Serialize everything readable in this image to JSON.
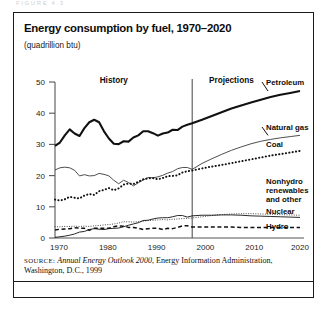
{
  "ghost_text": "FIGURE 4.3",
  "figure": {
    "title": "Energy consumption by fuel, 1970–2020",
    "subtitle": "(quadrillion btu)",
    "source": {
      "label": "SOURCE:",
      "italic_title": "Annual Energy Outlook 2000",
      "rest": ", Energy Information Administration, Washington, D.C., 1999"
    }
  },
  "chart_data": {
    "type": "line",
    "title": "Energy consumption by fuel, 1970–2020",
    "subtitle": "(quadrillion btu)",
    "xlabel": "",
    "ylabel": "quadrillion btu",
    "xlim": [
      1970,
      2020
    ],
    "ylim": [
      0,
      50
    ],
    "xticks": [
      1970,
      1980,
      1990,
      2000,
      2010,
      2020
    ],
    "yticks": [
      0,
      10,
      20,
      30,
      40,
      50
    ],
    "grid": false,
    "legend_position": "right-inline",
    "annotations": [
      {
        "text": "History",
        "x": 1982,
        "y": 47
      },
      {
        "text": "Projections",
        "x": 2006,
        "y": 47
      },
      {
        "text": "divider",
        "x": 1998,
        "y": null
      }
    ],
    "divider_year": 1998,
    "x": [
      1970,
      1971,
      1972,
      1973,
      1974,
      1975,
      1976,
      1977,
      1978,
      1979,
      1980,
      1981,
      1982,
      1983,
      1984,
      1985,
      1986,
      1987,
      1988,
      1989,
      1990,
      1991,
      1992,
      1993,
      1994,
      1995,
      1996,
      1997,
      1998,
      2000,
      2002,
      2004,
      2006,
      2008,
      2010,
      2012,
      2014,
      2016,
      2018,
      2020
    ],
    "series": [
      {
        "name": "Petroleum",
        "style": "thick-solid",
        "color": "#111111",
        "values": [
          29.5,
          30.6,
          32.9,
          34.8,
          33.5,
          32.7,
          35.2,
          37.1,
          37.9,
          37.1,
          34.2,
          31.9,
          30.2,
          30.1,
          31.0,
          30.9,
          32.2,
          32.9,
          34.2,
          34.2,
          33.6,
          32.8,
          33.5,
          33.8,
          34.7,
          34.6,
          35.7,
          36.3,
          36.8,
          37.9,
          39.1,
          40.3,
          41.5,
          42.5,
          43.4,
          44.3,
          45.2,
          45.9,
          46.5,
          47.1
        ]
      },
      {
        "name": "Natural gas",
        "style": "thin-solid",
        "color": "#3a3a3a",
        "values": [
          21.8,
          22.5,
          22.7,
          22.5,
          21.7,
          19.9,
          20.3,
          19.9,
          20.0,
          20.7,
          20.4,
          19.9,
          18.5,
          17.4,
          18.5,
          17.8,
          16.7,
          17.7,
          18.6,
          19.4,
          19.3,
          19.6,
          20.1,
          20.8,
          21.3,
          22.2,
          22.6,
          22.6,
          22.0,
          23.9,
          25.4,
          26.8,
          28.1,
          29.2,
          30.2,
          31.0,
          31.6,
          32.1,
          32.5,
          32.9
        ]
      },
      {
        "name": "Coal",
        "style": "bold-dotted",
        "color": "#111111",
        "values": [
          12.3,
          12.0,
          12.4,
          13.2,
          12.9,
          12.7,
          13.6,
          14.1,
          13.8,
          15.0,
          15.4,
          16.0,
          15.3,
          15.9,
          17.1,
          17.5,
          17.3,
          18.0,
          18.8,
          19.1,
          19.2,
          18.8,
          19.2,
          19.8,
          19.9,
          20.1,
          21.0,
          21.4,
          21.6,
          22.3,
          22.9,
          23.4,
          24.0,
          24.6,
          25.2,
          25.8,
          26.4,
          26.9,
          27.4,
          27.9
        ]
      },
      {
        "name": "Nonhydro renewables and other",
        "style": "fine-dotted",
        "color": "#4a4a4a",
        "values": [
          3.6,
          3.6,
          3.7,
          3.7,
          3.8,
          3.7,
          3.8,
          3.7,
          3.9,
          4.0,
          4.2,
          4.3,
          4.5,
          4.8,
          5.2,
          5.2,
          5.1,
          5.2,
          5.4,
          5.6,
          5.7,
          5.8,
          5.9,
          5.8,
          6.0,
          6.1,
          6.2,
          6.3,
          6.4,
          6.8,
          7.2,
          7.5,
          7.7,
          7.8,
          7.8,
          7.7,
          7.6,
          7.5,
          7.4,
          7.3
        ]
      },
      {
        "name": "Nuclear",
        "style": "thin-solid",
        "color": "#111111",
        "values": [
          0.2,
          0.4,
          0.6,
          0.9,
          1.3,
          1.9,
          2.1,
          2.7,
          3.0,
          2.8,
          2.7,
          3.0,
          3.1,
          3.2,
          3.6,
          4.1,
          4.5,
          4.9,
          5.6,
          5.7,
          6.1,
          6.4,
          6.5,
          6.5,
          6.8,
          7.2,
          7.2,
          6.7,
          7.1,
          7.3,
          7.3,
          7.4,
          7.4,
          7.3,
          7.1,
          7.0,
          6.9,
          6.8,
          6.7,
          6.6
        ]
      },
      {
        "name": "Hydro",
        "style": "dashed",
        "color": "#111111",
        "values": [
          2.6,
          2.8,
          2.9,
          3.0,
          3.3,
          3.2,
          3.1,
          2.5,
          3.1,
          3.1,
          3.1,
          3.1,
          3.6,
          3.9,
          3.8,
          3.4,
          3.4,
          3.1,
          2.7,
          3.0,
          3.1,
          3.1,
          2.7,
          3.1,
          3.0,
          3.4,
          3.9,
          3.9,
          3.5,
          3.5,
          3.5,
          3.5,
          3.5,
          3.4,
          3.4,
          3.4,
          3.4,
          3.4,
          3.4,
          3.4
        ]
      }
    ]
  },
  "axis": {
    "y_tick_labels": [
      "50",
      "40",
      "30",
      "20",
      "10",
      "0"
    ],
    "x_tick_labels": [
      "1970",
      "1980",
      "1990",
      "2000",
      "2010",
      "2020"
    ]
  },
  "labels": {
    "history": "History",
    "projections": "Projections",
    "petroleum": "Petroleum",
    "natural_gas": "Natural gas",
    "coal": "Coal",
    "nonhydro_line1": "Nonhydro",
    "nonhydro_line2": "renewables",
    "nonhydro_line3": "and other",
    "nuclear": "Nuclear",
    "hydro": "Hydro"
  }
}
